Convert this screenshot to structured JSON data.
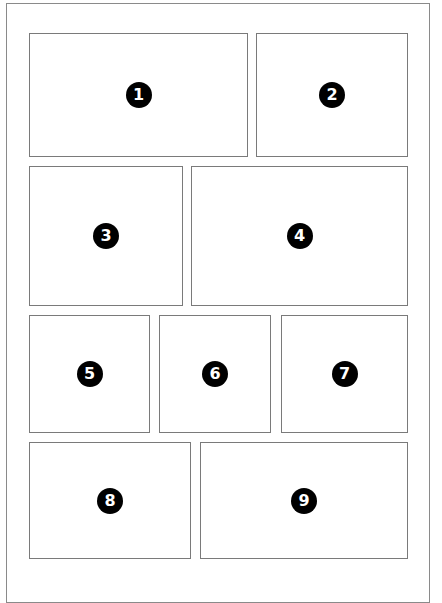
{
  "diagram": {
    "type": "comic-page-panel-layout",
    "rows": 4,
    "panels": [
      {
        "number": "1",
        "row": 1,
        "x": 29,
        "y": 33,
        "w": 219,
        "h": 124
      },
      {
        "number": "2",
        "row": 1,
        "x": 256,
        "y": 33,
        "w": 152,
        "h": 124
      },
      {
        "number": "3",
        "row": 2,
        "x": 29,
        "y": 166,
        "w": 154,
        "h": 140
      },
      {
        "number": "4",
        "row": 2,
        "x": 191,
        "y": 166,
        "w": 217,
        "h": 140
      },
      {
        "number": "5",
        "row": 3,
        "x": 29,
        "y": 315,
        "w": 121,
        "h": 118
      },
      {
        "number": "6",
        "row": 3,
        "x": 159,
        "y": 315,
        "w": 112,
        "h": 118
      },
      {
        "number": "7",
        "row": 3,
        "x": 281,
        "y": 315,
        "w": 127,
        "h": 118
      },
      {
        "number": "8",
        "row": 4,
        "x": 29,
        "y": 442,
        "w": 162,
        "h": 117
      },
      {
        "number": "9",
        "row": 4,
        "x": 200,
        "y": 442,
        "w": 208,
        "h": 117
      }
    ]
  }
}
